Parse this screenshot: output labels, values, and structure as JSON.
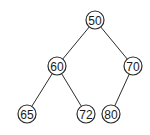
{
  "diagram": {
    "type": "binary-tree",
    "colors": {
      "stroke": "#2b2b2b",
      "text": "#1a1a1a",
      "fill": "#ffffff"
    },
    "nodes": [
      {
        "id": "n50",
        "label": "50",
        "x": 95,
        "y": 20
      },
      {
        "id": "n60",
        "label": "60",
        "x": 57,
        "y": 66
      },
      {
        "id": "n70",
        "label": "70",
        "x": 133,
        "y": 66
      },
      {
        "id": "n65",
        "label": "65",
        "x": 27,
        "y": 114
      },
      {
        "id": "n72",
        "label": "72",
        "x": 86,
        "y": 114
      },
      {
        "id": "n80",
        "label": "80",
        "x": 111,
        "y": 114
      }
    ],
    "edges": [
      {
        "from": "n50",
        "to": "n60"
      },
      {
        "from": "n50",
        "to": "n70"
      },
      {
        "from": "n60",
        "to": "n65"
      },
      {
        "from": "n60",
        "to": "n72"
      },
      {
        "from": "n70",
        "to": "n80"
      }
    ]
  }
}
